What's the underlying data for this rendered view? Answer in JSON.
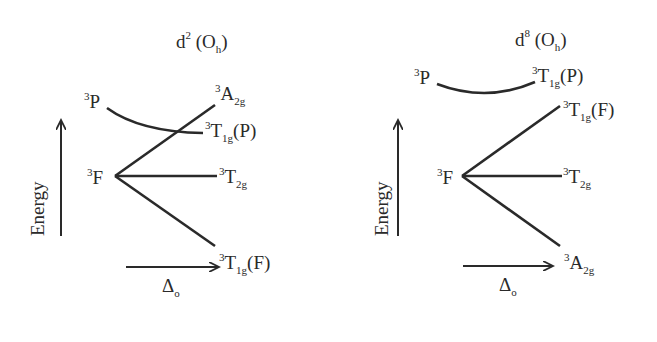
{
  "figure": {
    "diagrams": [
      {
        "id": "d2",
        "title": {
          "main": "d",
          "sup": "2",
          "paren_open": " (O",
          "sub": "h",
          "paren_close": ")"
        },
        "y_axis_label": "Energy",
        "x_axis_label": {
          "main": "Δ",
          "sub": "o"
        },
        "free_ion_terms": [
          {
            "mult": "3",
            "term": "P"
          },
          {
            "mult": "3",
            "term": "F"
          }
        ],
        "ligand_field_terms": [
          {
            "mult": "3",
            "sym": "A",
            "sub": "2g",
            "paren": "",
            "origin": "F",
            "position": "top"
          },
          {
            "mult": "3",
            "sym": "T",
            "sub": "1g",
            "paren": "(P)",
            "origin": "P",
            "position": "upper"
          },
          {
            "mult": "3",
            "sym": "T",
            "sub": "2g",
            "paren": "",
            "origin": "F",
            "position": "middle"
          },
          {
            "mult": "3",
            "sym": "T",
            "sub": "1g",
            "paren": "(F)",
            "origin": "F",
            "position": "bottom"
          }
        ]
      },
      {
        "id": "d8",
        "title": {
          "main": "d",
          "sup": "8",
          "paren_open": " (O",
          "sub": "h",
          "paren_close": ")"
        },
        "y_axis_label": "Energy",
        "x_axis_label": {
          "main": "Δ",
          "sub": "o"
        },
        "free_ion_terms": [
          {
            "mult": "3",
            "term": "P"
          },
          {
            "mult": "3",
            "term": "F"
          }
        ],
        "ligand_field_terms": [
          {
            "mult": "3",
            "sym": "T",
            "sub": "1g",
            "paren": "(P)",
            "origin": "P",
            "position": "top"
          },
          {
            "mult": "3",
            "sym": "T",
            "sub": "1g",
            "paren": "(F)",
            "origin": "F",
            "position": "upper"
          },
          {
            "mult": "3",
            "sym": "T",
            "sub": "2g",
            "paren": "",
            "origin": "F",
            "position": "middle"
          },
          {
            "mult": "3",
            "sym": "A",
            "sub": "2g",
            "paren": "",
            "origin": "F",
            "position": "bottom"
          }
        ]
      }
    ],
    "colors": {
      "ink": "#2a2a2a",
      "background": "#ffffff"
    }
  }
}
